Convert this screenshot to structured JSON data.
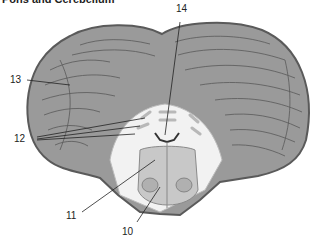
{
  "title": "Pons and Cerebellum",
  "labels": [
    {
      "id": "10",
      "text": "10"
    },
    {
      "id": "11",
      "text": "11"
    },
    {
      "id": "12",
      "text": "12"
    },
    {
      "id": "13",
      "text": "13"
    },
    {
      "id": "14",
      "text": "14"
    }
  ],
  "colors": {
    "cerebellum_fill": "#9a9a9a",
    "cerebellum_edge": "#5a5a5a",
    "folia_lines": "#4a4a4a",
    "white_matter": "#f2f2f2",
    "pons_fill": "#c8c8c8",
    "leader_line": "#222222"
  }
}
